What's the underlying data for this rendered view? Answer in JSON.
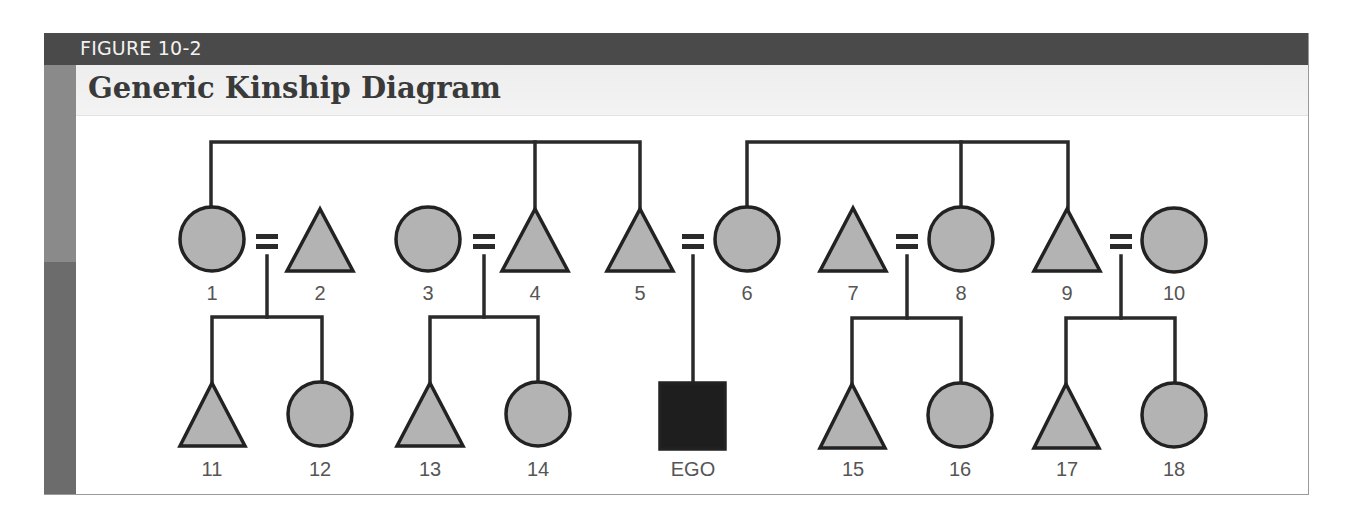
{
  "figure": {
    "label": "FIGURE 10-2",
    "title": "Generic Kinship Diagram"
  },
  "colors": {
    "topbar": "#4a4a4a",
    "sidebar_top": "#8a8a8a",
    "sidebar_bottom": "#6c6c6c",
    "node_fill": "#b3b3b3",
    "node_stroke": "#222222",
    "ego_fill": "#1e1e1e",
    "line": "#2a2a2a"
  },
  "nodes": [
    {
      "id": "1",
      "label": "1",
      "shape": "circle",
      "generation": 1
    },
    {
      "id": "2",
      "label": "2",
      "shape": "triangle",
      "generation": 1
    },
    {
      "id": "3",
      "label": "3",
      "shape": "circle",
      "generation": 1
    },
    {
      "id": "4",
      "label": "4",
      "shape": "triangle",
      "generation": 1
    },
    {
      "id": "5",
      "label": "5",
      "shape": "triangle",
      "generation": 1
    },
    {
      "id": "6",
      "label": "6",
      "shape": "circle",
      "generation": 1
    },
    {
      "id": "7",
      "label": "7",
      "shape": "triangle",
      "generation": 1
    },
    {
      "id": "8",
      "label": "8",
      "shape": "circle",
      "generation": 1
    },
    {
      "id": "9",
      "label": "9",
      "shape": "triangle",
      "generation": 1
    },
    {
      "id": "10",
      "label": "10",
      "shape": "circle",
      "generation": 1
    },
    {
      "id": "11",
      "label": "11",
      "shape": "triangle",
      "generation": 2
    },
    {
      "id": "12",
      "label": "12",
      "shape": "circle",
      "generation": 2
    },
    {
      "id": "13",
      "label": "13",
      "shape": "triangle",
      "generation": 2
    },
    {
      "id": "14",
      "label": "14",
      "shape": "circle",
      "generation": 2
    },
    {
      "id": "ego",
      "label": "EGO",
      "shape": "square",
      "generation": 2
    },
    {
      "id": "15",
      "label": "15",
      "shape": "triangle",
      "generation": 2
    },
    {
      "id": "16",
      "label": "16",
      "shape": "circle",
      "generation": 2
    },
    {
      "id": "17",
      "label": "17",
      "shape": "triangle",
      "generation": 2
    },
    {
      "id": "18",
      "label": "18",
      "shape": "circle",
      "generation": 2
    }
  ],
  "marriages": [
    {
      "spouses": [
        "1",
        "2"
      ],
      "children": [
        "11",
        "12"
      ]
    },
    {
      "spouses": [
        "3",
        "4"
      ],
      "children": [
        "13",
        "14"
      ]
    },
    {
      "spouses": [
        "5",
        "6"
      ],
      "children": [
        "ego"
      ]
    },
    {
      "spouses": [
        "7",
        "8"
      ],
      "children": [
        "15",
        "16"
      ]
    },
    {
      "spouses": [
        "9",
        "10"
      ],
      "children": [
        "17",
        "18"
      ]
    }
  ],
  "sibling_groups": [
    [
      "1",
      "4",
      "5"
    ],
    [
      "6",
      "8",
      "9"
    ]
  ],
  "legend": {
    "circle": "female",
    "triangle": "male",
    "square": "ego",
    "equals": "marriage"
  }
}
